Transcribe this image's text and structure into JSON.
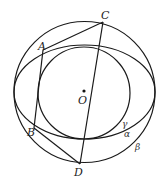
{
  "diagram": {
    "stroke_color": "#1a1a1a",
    "curves": {
      "outer_circle": {
        "name": "β",
        "cx": 84.5,
        "cy": 92,
        "r": 70.5
      },
      "ellipse": {
        "name": "α",
        "cx": 84.5,
        "cy": 92,
        "rx": 70.5,
        "ry": 47
      },
      "inner_circle": {
        "name": "γ",
        "cx": 84,
        "cy": 93,
        "r": 46
      }
    },
    "points": {
      "A": {
        "label": "A",
        "x": 43,
        "y": 50
      },
      "B": {
        "label": "B",
        "x": 34,
        "y": 128
      },
      "C": {
        "label": "C",
        "x": 103,
        "y": 22
      },
      "D": {
        "label": "D",
        "x": 80,
        "y": 164
      },
      "O": {
        "label": "O",
        "x": 84,
        "y": 91
      }
    },
    "segments": [
      "AC",
      "AB",
      "BD",
      "CD"
    ],
    "curve_labels": {
      "gamma": "γ",
      "alpha": "α",
      "beta": "β"
    }
  }
}
